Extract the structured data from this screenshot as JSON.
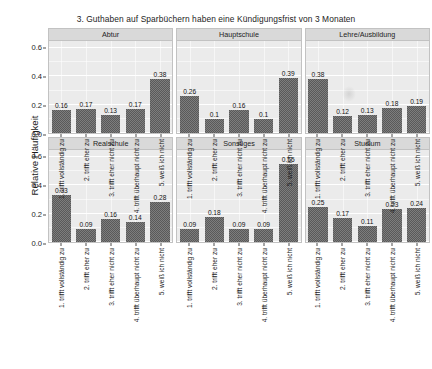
{
  "chart_data": {
    "type": "bar",
    "title": "3. Guthaben auf Sparbüchern haben eine Kündigungsfrist von 3 Monaten",
    "xlabel": "",
    "ylabel": "Relative Häufigkeit",
    "ylim": [
      0.0,
      0.65
    ],
    "yticks": [
      "0.0",
      "0.2",
      "0.4",
      "0.6"
    ],
    "ytick_values": [
      0.0,
      0.2,
      0.4,
      0.6
    ],
    "grid": true,
    "legend": "none",
    "facet_layout": "2 rows x 3 columns",
    "categories": [
      "1. trifft vollständig zu",
      "2. trifft eher zu",
      "3. trifft eher nicht zu",
      "4. trifft überhaupt nicht zu",
      "5. weiß ich nicht"
    ],
    "panels": [
      {
        "name": "Abtur",
        "values": [
          0.16,
          0.17,
          0.13,
          0.17,
          0.38
        ],
        "labels": [
          "0.16",
          "0.17",
          "0.13",
          "0.17",
          "0.38"
        ]
      },
      {
        "name": "Hauptschule",
        "values": [
          0.26,
          0.1,
          0.16,
          0.1,
          0.39
        ],
        "labels": [
          "0.26",
          "0.1",
          "0.16",
          "0.1",
          "0.39"
        ]
      },
      {
        "name": "Lehre/Ausbildung",
        "values": [
          0.38,
          0.12,
          0.13,
          0.18,
          0.19
        ],
        "labels": [
          "0.38",
          "0.12",
          "0.13",
          "0.18",
          "0.19"
        ]
      },
      {
        "name": "Realschule",
        "values": [
          0.33,
          0.09,
          0.16,
          0.14,
          0.28
        ],
        "labels": [
          "0.33",
          "0.09",
          "0.16",
          "0.14",
          "0.28"
        ]
      },
      {
        "name": "Sonstiges",
        "values": [
          0.09,
          0.18,
          0.09,
          0.09,
          0.55
        ],
        "labels": [
          "0.09",
          "0.18",
          "0.09",
          "0.09",
          "0.55"
        ]
      },
      {
        "name": "Studium",
        "values": [
          0.25,
          0.17,
          0.11,
          0.23,
          0.24
        ],
        "labels": [
          "0.25",
          "0.17",
          "0.11",
          "0.23",
          "0.24"
        ]
      }
    ],
    "colors": {
      "bar_fill": "#595959",
      "panel_background": "#ebebeb",
      "strip_background": "#d9d9d9",
      "gridline": "#ffffff",
      "text": "#1d1d1d",
      "page_background": "#ffffff"
    }
  }
}
